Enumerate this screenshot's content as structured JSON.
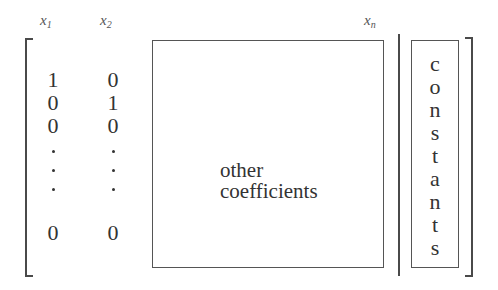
{
  "diagram": {
    "type": "augmented-matrix-schematic",
    "column_labels": [
      {
        "base": "x",
        "sub": "1"
      },
      {
        "base": "x",
        "sub": "2"
      },
      {
        "base": "x",
        "sub": "n"
      }
    ],
    "identity_columns": {
      "col1": [
        "1",
        "0",
        "0",
        "·",
        "·",
        "·",
        "0"
      ],
      "col2": [
        "0",
        "1",
        "0",
        "·",
        "·",
        "·",
        "0"
      ]
    },
    "coefficient_box": {
      "lines": [
        "other",
        "coefficients"
      ]
    },
    "constants_box": {
      "letters": [
        "c",
        "o",
        "n",
        "s",
        "t",
        "a",
        "n",
        "t",
        "s"
      ]
    },
    "colors": {
      "line": "#4a4a4a",
      "text": "#333333",
      "background": "#ffffff"
    }
  }
}
